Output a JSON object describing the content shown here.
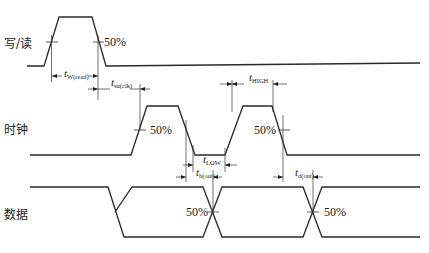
{
  "diagram": {
    "type": "timing-diagram",
    "colors": {
      "line": "#2a2a2a",
      "background": "#ffffff"
    },
    "signals": [
      {
        "id": "write_read",
        "label": "写/读"
      },
      {
        "id": "clock",
        "label": "时钟"
      },
      {
        "id": "data",
        "label": "数据"
      }
    ],
    "threshold_label": "50%",
    "parameters": {
      "t_w_read": {
        "symbol": "t",
        "subscript": "W(read)"
      },
      "t_su_clk": {
        "symbol": "t",
        "subscript": "su(clk)"
      },
      "t_high": {
        "symbol": "t",
        "subscript": "HIGH"
      },
      "t_low": {
        "symbol": "t",
        "subscript": "LOW"
      },
      "t_h_out": {
        "symbol": "t",
        "subscript": "h(out)"
      },
      "t_d_out": {
        "symbol": "t",
        "subscript": "d(out)"
      }
    }
  }
}
